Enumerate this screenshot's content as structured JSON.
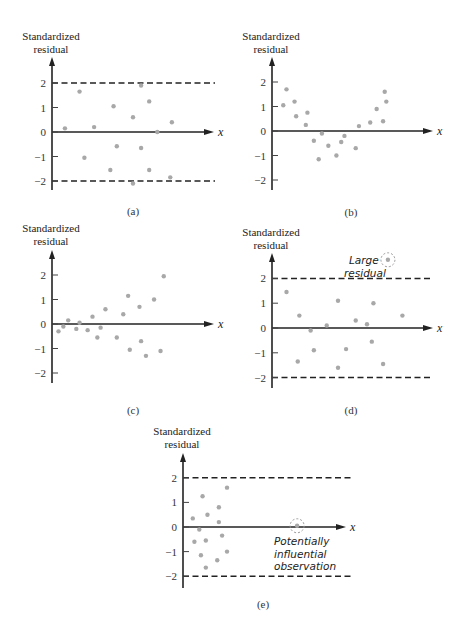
{
  "chart_data": [
    {
      "id": "a",
      "type": "scatter",
      "caption": "(a)",
      "ylabel": [
        "Standardized",
        "residual"
      ],
      "xlabel": "x",
      "yticks": [
        2,
        1,
        0,
        -1,
        -2
      ],
      "ylim": [
        -2.5,
        2.5
      ],
      "reference_lines": [
        2,
        -2
      ],
      "x": [
        0.08,
        0.17,
        0.2,
        0.26,
        0.36,
        0.38,
        0.4,
        0.5,
        0.5,
        0.55,
        0.55,
        0.6,
        0.6,
        0.65,
        0.73,
        0.74
      ],
      "y": [
        0.15,
        1.65,
        -1.05,
        0.2,
        -1.55,
        1.05,
        -0.58,
        0.6,
        -2.1,
        1.9,
        -0.65,
        1.25,
        -1.55,
        0.0,
        -1.85,
        0.4
      ],
      "annotations": []
    },
    {
      "id": "b",
      "type": "scatter",
      "caption": "(b)",
      "ylabel": [
        "Standardized",
        "residual"
      ],
      "xlabel": "x",
      "yticks": [
        2,
        1,
        0,
        -1,
        -2
      ],
      "ylim": [
        -2.5,
        2.5
      ],
      "reference_lines": [],
      "x": [
        0.07,
        0.09,
        0.14,
        0.15,
        0.22,
        0.21,
        0.26,
        0.31,
        0.29,
        0.35,
        0.4,
        0.43,
        0.45,
        0.52,
        0.54,
        0.61,
        0.65,
        0.69,
        0.7,
        0.71
      ],
      "y": [
        1.05,
        1.7,
        1.2,
        0.6,
        0.75,
        0.25,
        -0.4,
        -0.1,
        -1.15,
        -0.6,
        -1.0,
        -0.45,
        -0.2,
        -0.7,
        0.2,
        0.35,
        0.9,
        0.4,
        1.6,
        1.2
      ],
      "annotations": []
    },
    {
      "id": "c",
      "type": "scatter",
      "caption": "(c)",
      "ylabel": [
        "Standardized",
        "residual"
      ],
      "xlabel": "x",
      "yticks": [
        2,
        1,
        0,
        -1,
        -2
      ],
      "ylim": [
        -2.5,
        2.5
      ],
      "reference_lines": [],
      "x": [
        0.04,
        0.07,
        0.1,
        0.15,
        0.17,
        0.22,
        0.25,
        0.28,
        0.3,
        0.33,
        0.4,
        0.44,
        0.47,
        0.48,
        0.54,
        0.55,
        0.58,
        0.63,
        0.67,
        0.69
      ],
      "y": [
        -0.3,
        -0.1,
        0.15,
        -0.2,
        0.05,
        -0.25,
        0.3,
        -0.55,
        -0.15,
        0.6,
        -0.55,
        0.4,
        1.15,
        -1.05,
        0.7,
        -0.7,
        -1.3,
        1.0,
        -1.1,
        1.95
      ],
      "annotations": []
    },
    {
      "id": "d",
      "type": "scatter",
      "caption": "(d)",
      "ylabel": [
        "Standardized",
        "residual"
      ],
      "xlabel": "x",
      "yticks": [
        2,
        1,
        0,
        -1,
        -2
      ],
      "ylim": [
        -2.5,
        2.5
      ],
      "reference_lines": [
        2,
        -2
      ],
      "x": [
        0.09,
        0.17,
        0.16,
        0.24,
        0.26,
        0.34,
        0.41,
        0.41,
        0.46,
        0.52,
        0.59,
        0.63,
        0.62,
        0.69,
        0.81
      ],
      "y": [
        1.45,
        0.5,
        -1.35,
        -0.1,
        -0.9,
        0.1,
        1.1,
        -1.6,
        -0.85,
        0.3,
        0.15,
        1.0,
        -0.55,
        -1.45,
        0.5
      ],
      "highlight": {
        "x": 0.72,
        "y": 2.75,
        "label": [
          "Large",
          "residual"
        ]
      },
      "annotations": [
        "Large residual"
      ]
    },
    {
      "id": "e",
      "type": "scatter",
      "caption": "(e)",
      "ylabel": [
        "Standardized",
        "residual"
      ],
      "xlabel": "x",
      "yticks": [
        2,
        1,
        0,
        -1,
        -2
      ],
      "ylim": [
        -2.5,
        2.5
      ],
      "reference_lines": [
        2,
        -2
      ],
      "x": [
        0.06,
        0.07,
        0.1,
        0.12,
        0.11,
        0.14,
        0.15,
        0.14,
        0.21,
        0.22,
        0.22,
        0.24,
        0.27,
        0.27
      ],
      "y": [
        0.35,
        -0.6,
        -0.1,
        1.25,
        -1.15,
        -0.55,
        0.5,
        -1.65,
        -1.35,
        0.8,
        0.2,
        -0.35,
        -1.0,
        1.6
      ],
      "highlight": {
        "x": 0.7,
        "y": 0.05,
        "label": [
          "Potentially",
          "influential",
          "observation"
        ]
      },
      "annotations": [
        "Potentially influential observation"
      ]
    }
  ],
  "layout": [
    {
      "ox": 52,
      "oy": 132,
      "unit": 24.5,
      "xend": 214,
      "top": 57,
      "bottom": 190,
      "dashEnd": 215,
      "labelX": 51,
      "labelY": 40,
      "capX": 133,
      "capY": 215,
      "width": 162
    },
    {
      "ox": 272,
      "oy": 131,
      "unit": 24.5,
      "xend": 433,
      "top": 57,
      "bottom": 190,
      "dashEnd": 433,
      "labelX": 271,
      "labelY": 40,
      "capX": 351,
      "capY": 216,
      "width": 161
    },
    {
      "ox": 52,
      "oy": 324,
      "unit": 24.5,
      "xend": 214,
      "top": 250,
      "bottom": 383,
      "dashEnd": 215,
      "labelX": 51,
      "labelY": 232,
      "capX": 133,
      "capY": 414,
      "width": 162
    },
    {
      "ox": 272,
      "oy": 328,
      "unit": 24.8,
      "xend": 433,
      "top": 253,
      "bottom": 388,
      "dashEnd": 433,
      "labelX": 271,
      "labelY": 236,
      "capX": 351,
      "capY": 414,
      "width": 161
    },
    {
      "ox": 183,
      "oy": 527,
      "unit": 24.6,
      "xend": 346,
      "top": 453,
      "bottom": 588,
      "dashEnd": 351,
      "labelX": 182,
      "labelY": 435,
      "capX": 263,
      "capY": 608,
      "width": 163
    }
  ]
}
